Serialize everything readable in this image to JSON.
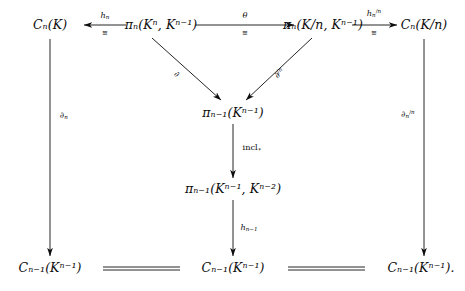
{
  "figure": {
    "kind": "commutative-diagram",
    "background": "#ffffff",
    "ink": "#0d0d0d",
    "width": 465,
    "height": 291
  },
  "nodes": {
    "top_left": "Cₙ(K)",
    "top_mid_left": "πₙ(Kⁿ, Kⁿ⁻¹)",
    "top_mid_right": "πₙ(K/n, Kⁿ⁻¹)",
    "top_right": "Cₙ(K/n)",
    "center_upper": "πₙ₋₁(Kⁿ⁻¹)",
    "center_lower": "πₙ₋₁(Kⁿ⁻¹, Kⁿ⁻²)",
    "bottom_left": "Cₙ₋₁(Kⁿ⁻¹)",
    "bottom_mid": "Cₙ₋₁(Kⁿ⁻¹)",
    "bottom_right": "Cₙ₋₁(Kⁿ⁻¹)."
  },
  "arrow_labels": {
    "h_n": "hₙ",
    "theta": "θ",
    "h_n_mod": "hₙ^{/n}",
    "partial": "∂",
    "partial_mod": "∂^{/n}",
    "partial_n": "∂ₙ",
    "partial_n_mod": "∂ₙ^{/n}",
    "incl": "incl∗",
    "h_n_minus_1": "hₙ₋₁",
    "iso": "≅"
  },
  "arrows": [
    {
      "name": "h-n-arrow",
      "from": "top_mid_left",
      "to": "top_left",
      "direction": "left",
      "label": "hₙ",
      "sublabel": "≅"
    },
    {
      "name": "theta-arrow",
      "from": "top_mid_left",
      "to": "top_mid_right",
      "direction": "right",
      "label": "θ",
      "sublabel": "≅"
    },
    {
      "name": "h-n-mod-arrow",
      "from": "top_mid_right",
      "to": "top_right",
      "direction": "right",
      "label": "hₙ^{/n}",
      "sublabel": "≅"
    },
    {
      "name": "partial-diagonal-arrow",
      "from": "top_mid_left",
      "to": "center_upper",
      "direction": "down-right",
      "label": "∂"
    },
    {
      "name": "partial-mod-diagonal-arrow",
      "from": "top_mid_right",
      "to": "center_upper",
      "direction": "down-left",
      "label": "∂^{/n}"
    },
    {
      "name": "incl-arrow",
      "from": "center_upper",
      "to": "center_lower",
      "direction": "down",
      "label": "incl∗"
    },
    {
      "name": "h-n-minus-1-arrow",
      "from": "center_lower",
      "to": "bottom_mid",
      "direction": "down",
      "label": "hₙ₋₁"
    },
    {
      "name": "partial-n-arrow",
      "from": "top_left",
      "to": "bottom_left",
      "direction": "down",
      "label": "∂ₙ"
    },
    {
      "name": "partial-n-mod-arrow",
      "from": "top_right",
      "to": "bottom_right",
      "direction": "down",
      "label": "∂ₙ^{/n}"
    },
    {
      "name": "equality-left",
      "from": "bottom_left",
      "to": "bottom_mid",
      "direction": "equals"
    },
    {
      "name": "equality-right",
      "from": "bottom_mid",
      "to": "bottom_right",
      "direction": "equals"
    }
  ]
}
